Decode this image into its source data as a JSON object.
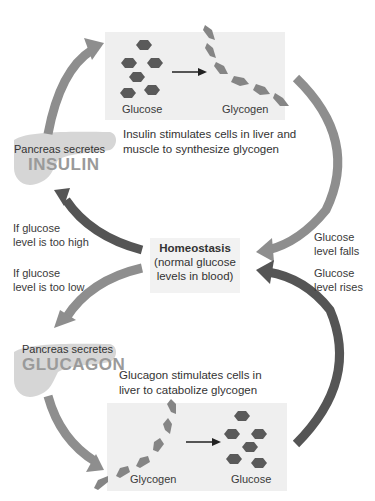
{
  "top_panel": {
    "left_label": "Glucose",
    "right_label": "Glycogen",
    "caption_line1": "Insulin stimulates cells in liver and",
    "caption_line2": "muscle to synthesize glycogen"
  },
  "insulin_pancreas": {
    "line1": "Pancreas secretes",
    "hormone": "INSULIN"
  },
  "left_labels": {
    "too_high_line1": "If glucose",
    "too_high_line2": "level is too high",
    "too_low_line1": "If glucose",
    "too_low_line2": "level is too low"
  },
  "homeostasis": {
    "title": "Homeostasis",
    "line1": "(normal glucose",
    "line2": "levels in blood)"
  },
  "right_labels": {
    "falls_line1": "Glucose",
    "falls_line2": "level falls",
    "rises_line1": "Glucose",
    "rises_line2": "level rises"
  },
  "glucagon_pancreas": {
    "line1": "Pancreas secretes",
    "hormone": "GLUCAGON"
  },
  "bottom_panel": {
    "caption_line1": "Glucagon stimulates cells in",
    "caption_line2": "liver to catabolize glycogen",
    "left_label": "Glycogen",
    "right_label": "Glucose"
  },
  "colors": {
    "light_arrow": "#8e8e8e",
    "dark_arrow": "#555555",
    "glucose_hex": "#5a5a5a",
    "glycogen_hex": "#858585",
    "panel_bg": "#efefef",
    "pancreas": "#d4d4d4"
  }
}
